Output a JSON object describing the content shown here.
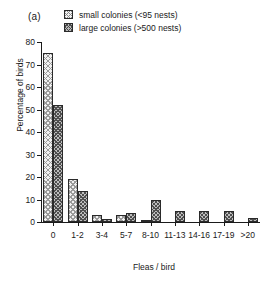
{
  "panel": {
    "label": "(a)"
  },
  "legend": {
    "items": [
      {
        "label": "small colonies (<95 nests)",
        "pattern": "light-cross-hatch"
      },
      {
        "label": "large colonies (>500 nests)",
        "pattern": "dark-cross-hatch"
      }
    ]
  },
  "chart_data": {
    "type": "bar",
    "title": "",
    "xlabel": "Fleas / bird",
    "ylabel": "Percentage of birds",
    "categories": [
      "0",
      "1-2",
      "3-4",
      "5-7",
      "8-10",
      "11-13",
      "14-16",
      "17-19",
      ">20"
    ],
    "series": [
      {
        "name": "small colonies (<95 nests)",
        "values": [
          75,
          19,
          3,
          3,
          1,
          0,
          0,
          0,
          0
        ]
      },
      {
        "name": "large colonies (>500 nests)",
        "values": [
          52,
          14,
          1.5,
          4,
          10,
          5,
          5,
          5,
          2
        ]
      }
    ],
    "ylim": [
      0,
      80
    ],
    "yticks": [
      0,
      10,
      20,
      30,
      40,
      50,
      60,
      70,
      80
    ],
    "grid": false,
    "legend_position": "top"
  }
}
